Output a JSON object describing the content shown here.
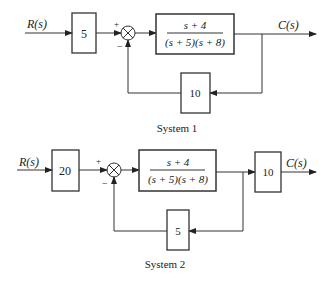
{
  "systems": [
    {
      "caption": "System 1",
      "input_label": "R(s)",
      "output_label": "C(s)",
      "pre_gain": "5",
      "sum_plus": "+",
      "sum_minus": "−",
      "plant": {
        "numerator": "s + 4",
        "denominator": "(s + 5)(s + 8)"
      },
      "feedback_gain": "10"
    },
    {
      "caption": "System 2",
      "input_label": "R(s)",
      "output_label": "C(s)",
      "pre_gain": "20",
      "sum_plus": "+",
      "sum_minus": "−",
      "plant": {
        "numerator": "s + 4",
        "denominator": "(s + 5)(s + 8)"
      },
      "post_gain": "10",
      "feedback_gain": "5"
    }
  ]
}
